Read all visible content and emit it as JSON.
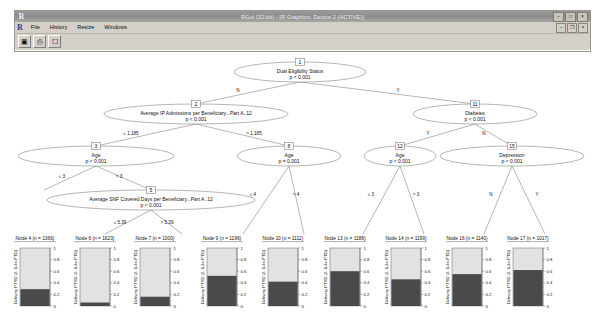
{
  "window": {
    "title": "RGui (32-bit) - [R Graphics: Device 2 (ACTIVE)]",
    "app_initial": "R",
    "menu": [
      {
        "name": "file",
        "label": "File"
      },
      {
        "name": "history",
        "label": "History"
      },
      {
        "name": "resize",
        "label": "Resize"
      },
      {
        "name": "windows",
        "label": "Windows"
      }
    ],
    "title_buttons": [
      {
        "name": "minimize",
        "glyph": "–"
      },
      {
        "name": "maximize",
        "glyph": "□"
      },
      {
        "name": "close",
        "glyph": "×"
      }
    ],
    "mdi_buttons": [
      {
        "name": "mdi-minimize",
        "glyph": "–"
      },
      {
        "name": "mdi-restore",
        "glyph": "❐"
      },
      {
        "name": "mdi-close",
        "glyph": "×"
      }
    ],
    "toolbar": [
      {
        "name": "copy-to-clipboard",
        "glyph": "▣"
      },
      {
        "name": "print",
        "glyph": "⎙"
      },
      {
        "name": "new-window",
        "glyph": "☐"
      }
    ]
  },
  "chart_data": {
    "type": "tree",
    "title": "",
    "inner_nodes": [
      {
        "id": 1,
        "label": "Dual Eligibility Status",
        "p": "p < 0.001",
        "cx": 300,
        "cy": 20,
        "rx": 66,
        "ry": 10
      },
      {
        "id": 2,
        "label": "Average IP Admissions per Beneficiary...Part A..12",
        "p": "p < 0.001",
        "cx": 196,
        "cy": 62,
        "rx": 92,
        "ry": 10
      },
      {
        "id": 11,
        "label": "Diabetes",
        "p": "p < 0.001",
        "cx": 475,
        "cy": 62,
        "rx": 62,
        "ry": 10
      },
      {
        "id": 3,
        "label": "Age",
        "p": "p < 0.001",
        "cx": 96,
        "cy": 104,
        "rx": 78,
        "ry": 10
      },
      {
        "id": 8,
        "label": "Age",
        "p": "p = 0.001",
        "cx": 289,
        "cy": 104,
        "rx": 52,
        "ry": 10
      },
      {
        "id": 12,
        "label": "Age",
        "p": "p < 0.001",
        "cx": 400,
        "cy": 104,
        "rx": 36,
        "ry": 10
      },
      {
        "id": 15,
        "label": "Depression",
        "p": "p < 0.001",
        "cx": 512,
        "cy": 104,
        "rx": 72,
        "ry": 10
      },
      {
        "id": 5,
        "label": "Average SNF Covered Days per Beneficiary...Part A..12",
        "p": "p < 0.001",
        "cx": 151,
        "cy": 148,
        "rx": 104,
        "ry": 10
      }
    ],
    "edges": [
      {
        "from": 1,
        "to": 2,
        "label": "N",
        "x1": 300,
        "y1": 30,
        "x2": 196,
        "y2": 52,
        "lx": 238,
        "ly": 40
      },
      {
        "from": 1,
        "to": 11,
        "label": "Y",
        "x1": 300,
        "y1": 30,
        "x2": 475,
        "y2": 52,
        "lx": 398,
        "ly": 40
      },
      {
        "from": 2,
        "to": 3,
        "label": "≤ 1.185",
        "x1": 196,
        "y1": 72,
        "x2": 96,
        "y2": 94,
        "lx": 131,
        "ly": 83
      },
      {
        "from": 2,
        "to": 8,
        "label": "> 1.185",
        "x1": 196,
        "y1": 72,
        "x2": 289,
        "y2": 94,
        "lx": 254,
        "ly": 83
      },
      {
        "from": 11,
        "to": 12,
        "label": "Y",
        "x1": 475,
        "y1": 72,
        "x2": 400,
        "y2": 94,
        "lx": 428,
        "ly": 83
      },
      {
        "from": 11,
        "to": 15,
        "label": "N",
        "x1": 475,
        "y1": 72,
        "x2": 512,
        "y2": 94,
        "lx": 484,
        "ly": 83
      },
      {
        "from": 3,
        "to": 4,
        "label": "≤ 3",
        "x1": 96,
        "y1": 114,
        "x2": 44,
        "y2": 138,
        "lx": 62,
        "ly": 126
      },
      {
        "from": 3,
        "to": 5,
        "label": "> 3",
        "x1": 96,
        "y1": 114,
        "x2": 151,
        "y2": 138,
        "lx": 119,
        "ly": 126
      },
      {
        "from": 5,
        "to": 6,
        "label": "≤ 5.39",
        "x1": 151,
        "y1": 158,
        "x2": 105,
        "y2": 182,
        "lx": 120,
        "ly": 172
      },
      {
        "from": 5,
        "to": 7,
        "label": "> 5.39",
        "x1": 151,
        "y1": 158,
        "x2": 182,
        "y2": 182,
        "lx": 167,
        "ly": 172
      },
      {
        "from": 8,
        "to": 9,
        "label": "≤ 4",
        "x1": 289,
        "y1": 114,
        "x2": 243,
        "y2": 182,
        "lx": 253,
        "ly": 144
      },
      {
        "from": 8,
        "to": 10,
        "label": "> 4",
        "x1": 289,
        "y1": 114,
        "x2": 304,
        "y2": 182,
        "lx": 296,
        "ly": 144
      },
      {
        "from": 12,
        "to": 13,
        "label": "≤ 3",
        "x1": 400,
        "y1": 114,
        "x2": 363,
        "y2": 182,
        "lx": 371,
        "ly": 144
      },
      {
        "from": 12,
        "to": 14,
        "label": "> 3",
        "x1": 400,
        "y1": 114,
        "x2": 424,
        "y2": 182,
        "lx": 416,
        "ly": 144
      },
      {
        "from": 15,
        "to": 16,
        "label": "N",
        "x1": 512,
        "y1": 114,
        "x2": 484,
        "y2": 182,
        "lx": 491,
        "ly": 144
      },
      {
        "from": 15,
        "to": 17,
        "label": "Y",
        "x1": 512,
        "y1": 114,
        "x2": 545,
        "y2": 182,
        "lx": 537,
        "ly": 144
      }
    ],
    "leaves": [
      {
        "id": 4,
        "label": "Node 4 (n = 1366)",
        "n": 1366,
        "x": 20,
        "dark": 0.29,
        "ylabel": "Delivery PTSD (2..6.4e-PTD)"
      },
      {
        "id": 6,
        "label": "Node 6 (n = 1623)",
        "n": 1623,
        "x": 80,
        "dark": 0.06,
        "ylabel": "Delivery PTSD (2..6.4e-PTD)"
      },
      {
        "id": 7,
        "label": "Node 7 (n = 1000)",
        "n": 1000,
        "x": 140,
        "dark": 0.16,
        "ylabel": "Delivery PTSD (2..6.4e-PTD)"
      },
      {
        "id": 9,
        "label": "Node 9 (n = 1196)",
        "n": 1196,
        "x": 207,
        "dark": 0.52,
        "ylabel": "Delivery PTSD (2..6.4e-PTD)"
      },
      {
        "id": 10,
        "label": "Node 10 (n = 1112)",
        "n": 1112,
        "x": 268,
        "dark": 0.42,
        "ylabel": "Delivery PTSD (2..6.4e-PTD)"
      },
      {
        "id": 13,
        "label": "Node 13 (n = 1188)",
        "n": 1188,
        "x": 330,
        "dark": 0.6,
        "ylabel": "Delivery PTSD (2..6.4e-PTD)"
      },
      {
        "id": 14,
        "label": "Node 14 (n = 1199)",
        "n": 1199,
        "x": 391,
        "dark": 0.46,
        "ylabel": "Delivery PTSD (2..6.4e-PTD)"
      },
      {
        "id": 16,
        "label": "Node 16 (n = 1140)",
        "n": 1140,
        "x": 452,
        "dark": 0.55,
        "ylabel": "Delivery PTSD (2..6.4e-PTD)"
      },
      {
        "id": 17,
        "label": "Node 17 (n = 1017)",
        "n": 1017,
        "x": 513,
        "dark": 0.62,
        "ylabel": "Delivery PTSD (2..6.4e-PTD)"
      }
    ],
    "y_ticks": [
      "0",
      "0.2",
      "0.4",
      "0.6",
      "0.8",
      "1"
    ],
    "ylim": [
      0,
      1
    ],
    "colors": {
      "bar_fill_dark": "#4a4a4a",
      "bar_fill_light": "#e2e2e2",
      "stroke": "#555555"
    }
  }
}
